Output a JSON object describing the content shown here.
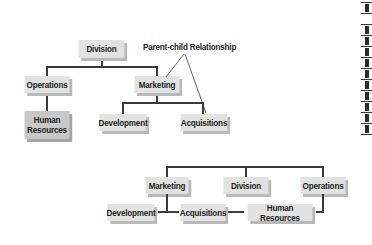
{
  "annotation": {
    "label": "Parent-child Relationship"
  },
  "hierarchy_diagram": {
    "root": "Division",
    "level1": [
      "Operations",
      "Marketing"
    ],
    "operations_children": [
      "Human Resources"
    ],
    "operations_children_display": [
      "Human",
      "Resources"
    ],
    "marketing_children": [
      "Development",
      "Acquisitions"
    ]
  },
  "flat_diagram": {
    "top_row": [
      "Marketing",
      "Division",
      "Operations"
    ],
    "bottom_row": [
      "Development",
      "Acquisitions",
      "Human Resources"
    ]
  },
  "colors": {
    "box_fill": "#e2e2e2",
    "box_fill_dark": "#c8c8c8",
    "shadow": "#b9b9b9",
    "line": "#3a3a3a",
    "text": "#1e1e1e"
  }
}
